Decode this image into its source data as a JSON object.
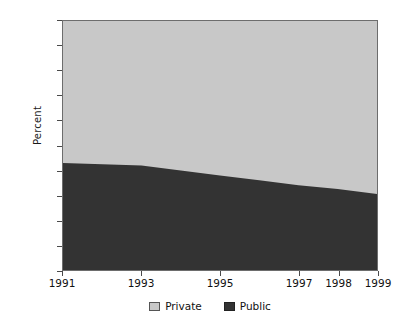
{
  "chart_data": {
    "type": "area",
    "stacked": true,
    "title": "",
    "subtitle": "",
    "xlabel": "",
    "ylabel": "Percent",
    "ylim": [
      0,
      100
    ],
    "xlim": [
      1991,
      1999
    ],
    "grid": false,
    "legend_position": "bottom",
    "x": [
      1991,
      1992,
      1993,
      1994,
      1995,
      1996,
      1997,
      1998,
      1999
    ],
    "xtick_labels": [
      "1991",
      "1993",
      "1995",
      "1997",
      "1998",
      "1999"
    ],
    "xtick_values": [
      1991,
      1993,
      1995,
      1997,
      1998,
      1999
    ],
    "ytick_labels": [
      "0",
      "10",
      "20",
      "30",
      "40",
      "50",
      "60",
      "70",
      "80",
      "90",
      "100"
    ],
    "ytick_values": [
      0,
      10,
      20,
      30,
      40,
      50,
      60,
      70,
      80,
      90,
      100
    ],
    "series": [
      {
        "name": "Public",
        "color": "#333333",
        "values": [
          43,
          42.5,
          42,
          40,
          38,
          36,
          34,
          32.5,
          30.5
        ]
      },
      {
        "name": "Private",
        "color": "#c8c8c8",
        "values": [
          57,
          57.5,
          58,
          60,
          62,
          64,
          66,
          67.5,
          69.5
        ]
      }
    ],
    "annotations": []
  },
  "legend": {
    "items": [
      {
        "label": "Private",
        "swatch": "private-swatch"
      },
      {
        "label": "Public",
        "swatch": "public-swatch"
      }
    ]
  },
  "colors": {
    "private": "#c8c8c8",
    "public": "#333333",
    "axis": "#6d6d6d",
    "text": "#111111",
    "background": "#ffffff"
  }
}
